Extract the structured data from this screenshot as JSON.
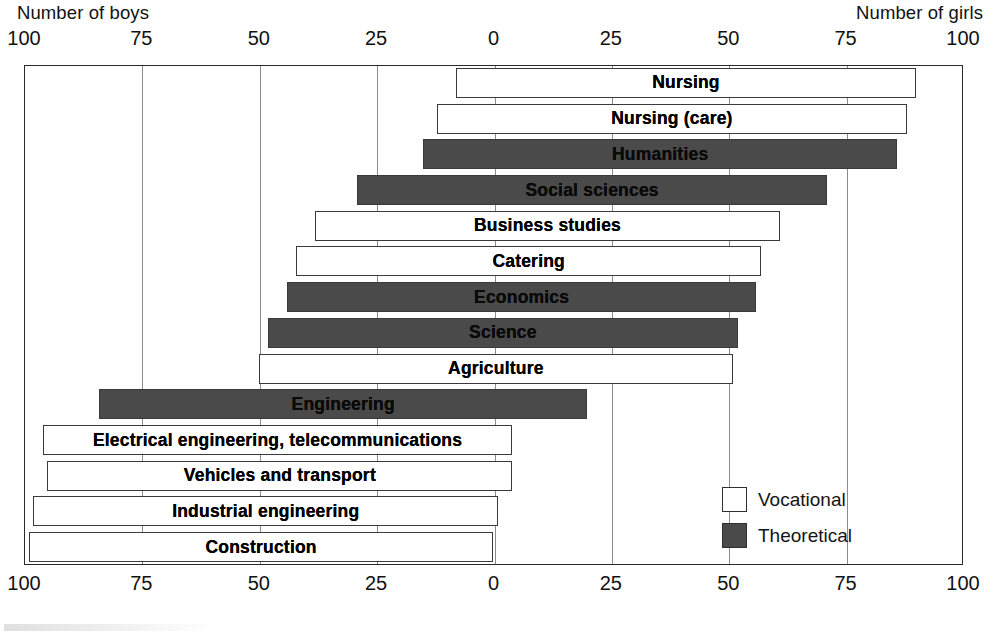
{
  "chart_data": {
    "type": "bar",
    "subtype": "diverging-horizontal-population-pyramid",
    "title": "",
    "left_axis_label": "Number of boys",
    "right_axis_label": "Number of girls",
    "xlabel": "",
    "ylabel": "",
    "axis_ticks_top": [
      "100",
      "75",
      "50",
      "25",
      "0",
      "25",
      "50",
      "75",
      "100"
    ],
    "axis_ticks_bottom": [
      "100",
      "75",
      "50",
      "25",
      "0",
      "25",
      "50",
      "75",
      "100"
    ],
    "xlim": [
      -100,
      100
    ],
    "tick_step": 25,
    "grid": true,
    "legend_position": "inside-bottom-right",
    "legend": [
      {
        "label": "Vocational",
        "color": "#ffffff"
      },
      {
        "label": "Theoretical",
        "color": "#4a4a4a"
      }
    ],
    "series_names": [
      "Number of boys",
      "Number of girls"
    ],
    "categories": [
      "Nursing",
      "Nursing (care)",
      "Humanities",
      "Social sciences",
      "Business studies",
      "Catering",
      "Economics",
      "Science",
      "Agriculture",
      "Engineering",
      "Electrical engineering, telecommunications",
      "Vehicles and transport",
      "Industrial engineering",
      "Construction"
    ],
    "rows": [
      {
        "label": "Nursing",
        "type": "Vocational",
        "boys": 8,
        "girls": 90
      },
      {
        "label": "Nursing (care)",
        "type": "Vocational",
        "boys": 12,
        "girls": 88
      },
      {
        "label": "Humanities",
        "type": "Theoretical",
        "boys": 15,
        "girls": 86
      },
      {
        "label": "Social sciences",
        "type": "Theoretical",
        "boys": 29,
        "girls": 71
      },
      {
        "label": "Business studies",
        "type": "Vocational",
        "boys": 38,
        "girls": 61
      },
      {
        "label": "Catering",
        "type": "Vocational",
        "boys": 42,
        "girls": 57
      },
      {
        "label": "Economics",
        "type": "Theoretical",
        "boys": 44,
        "girls": 56
      },
      {
        "label": "Science",
        "type": "Theoretical",
        "boys": 48,
        "girls": 52
      },
      {
        "label": "Agriculture",
        "type": "Vocational",
        "boys": 50,
        "girls": 51
      },
      {
        "label": "Engineering",
        "type": "Theoretical",
        "boys": 84,
        "girls": 20
      },
      {
        "label": "Electrical engineering, telecommunications",
        "type": "Vocational",
        "boys": 96,
        "girls": 4
      },
      {
        "label": "Vehicles and transport",
        "type": "Vocational",
        "boys": 95,
        "girls": 4
      },
      {
        "label": "Industrial engineering",
        "type": "Vocational",
        "boys": 98,
        "girls": 1
      },
      {
        "label": "Construction",
        "type": "Vocational",
        "boys": 99,
        "girls": 0
      }
    ],
    "colors": {
      "vocational_fill": "#ffffff",
      "theoretical_fill": "#4a4a4a",
      "bar_border": "#3a3a3a",
      "gridline": "#8b8b8b",
      "frame": "#2a2a2a",
      "text": "#111111"
    }
  }
}
